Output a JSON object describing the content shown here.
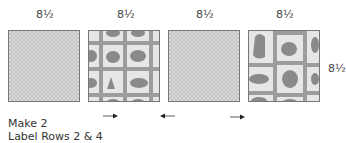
{
  "dimension_labels": {
    "top": [
      "8½",
      "8½",
      "8½",
      "8½"
    ],
    "side": "8½"
  },
  "blocks": [
    {
      "fabric": "solid-tone-on-tone",
      "arrow": null
    },
    {
      "fabric": "animal-print",
      "arrow": "right"
    },
    {
      "fabric": "solid-tone-on-tone",
      "arrow": "left"
    },
    {
      "fabric": "animal-print",
      "arrow": "right"
    }
  ],
  "instructions": {
    "line1": "Make 2",
    "line2": "Label Rows 2 & 4"
  }
}
